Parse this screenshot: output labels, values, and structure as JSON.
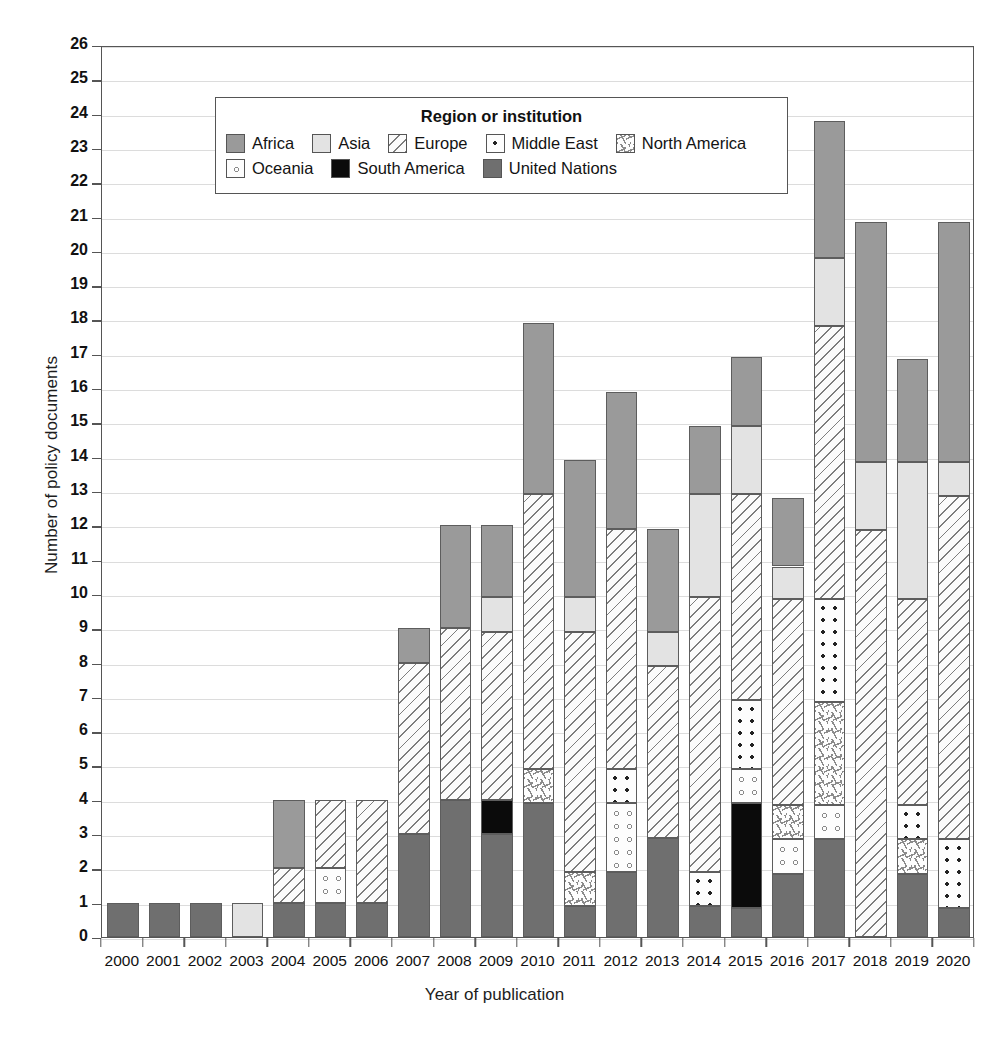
{
  "chart_data": {
    "type": "bar",
    "subtype": "stacked-bar",
    "title": "",
    "xlabel": "Year of publication",
    "ylabel": "Number of policy documents",
    "ylim": [
      0,
      26
    ],
    "ytick_step": 1,
    "grid": true,
    "legend_position": "inside-top-center",
    "legend_title": "Region or institution",
    "categories": [
      "2000",
      "2001",
      "2002",
      "2003",
      "2004",
      "2005",
      "2006",
      "2007",
      "2008",
      "2009",
      "2010",
      "2011",
      "2012",
      "2013",
      "2014",
      "2015",
      "2016",
      "2017",
      "2018",
      "2019",
      "2020"
    ],
    "ytick_labels": [
      "0",
      "1",
      "2",
      "3",
      "4",
      "5",
      "6",
      "7",
      "8",
      "9",
      "10",
      "11",
      "12",
      "13",
      "14",
      "15",
      "16",
      "17",
      "18",
      "19",
      "20",
      "21",
      "22",
      "23",
      "24",
      "25",
      "26"
    ],
    "series": [
      {
        "name": "United Nations",
        "key": "un",
        "color": "#6f6f6f",
        "pattern": "solid-dark-gray",
        "values": [
          1,
          1,
          1,
          0,
          1,
          1,
          1,
          3,
          4,
          3,
          3.9,
          0.9,
          1.9,
          2.9,
          0.9,
          0.85,
          1.85,
          2.85,
          0,
          1.85,
          0.85
        ]
      },
      {
        "name": "South America",
        "key": "samerica",
        "color": "#0b0b0b",
        "pattern": "solid-black",
        "values": [
          0,
          0,
          0,
          0,
          0,
          0,
          0,
          0,
          0,
          1,
          0,
          0,
          0,
          0,
          0,
          3.05,
          0,
          0,
          0,
          0,
          0
        ]
      },
      {
        "name": "Oceania",
        "key": "oceania",
        "color": "#fdfdfd",
        "pattern": "open-circles",
        "values": [
          0,
          0,
          0,
          0,
          0,
          1,
          0,
          0,
          0,
          0,
          0,
          0,
          2,
          0,
          0,
          1,
          1,
          1,
          0,
          0,
          0
        ]
      },
      {
        "name": "North America",
        "key": "namerica",
        "color": "#fdfdfd",
        "pattern": "sparse-dashes",
        "values": [
          0,
          0,
          0,
          0,
          0,
          0,
          0,
          0,
          0,
          0,
          1,
          1,
          0,
          0,
          0,
          0,
          1,
          3,
          0,
          1,
          0
        ]
      },
      {
        "name": "Middle East",
        "key": "mideast",
        "color": "#fdfdfd",
        "pattern": "dots",
        "values": [
          0,
          0,
          0,
          0,
          0,
          0,
          0,
          0,
          0,
          0,
          0,
          0,
          1,
          0,
          1,
          2,
          0,
          3,
          0,
          1,
          2
        ]
      },
      {
        "name": "Europe",
        "key": "europe",
        "color": "#fbfbfb",
        "pattern": "diagonal-hatch",
        "values": [
          0,
          0,
          0,
          0,
          1,
          2,
          3,
          5,
          5,
          4.9,
          8,
          7,
          7,
          5,
          8,
          6,
          6,
          7.95,
          11.85,
          6,
          10
        ]
      },
      {
        "name": "Asia",
        "key": "asia",
        "color": "#e3e3e3",
        "pattern": "solid-light-gray",
        "values": [
          0,
          0,
          0,
          1,
          0,
          0,
          0,
          0,
          0,
          1,
          0,
          1,
          0,
          1,
          3,
          2,
          0.95,
          2,
          2,
          4,
          1
        ]
      },
      {
        "name": "Africa",
        "key": "africa",
        "color": "#9a9a9a",
        "pattern": "solid-medium-gray",
        "values": [
          0,
          0,
          0,
          0,
          2,
          0,
          0,
          1,
          3,
          2.1,
          5,
          4,
          4,
          3,
          2,
          2,
          2,
          4,
          7,
          3,
          7
        ]
      }
    ],
    "totals": [
      1,
      1,
      1,
      1,
      4,
      4,
      4,
      9,
      12,
      12,
      17.9,
      13.9,
      15.9,
      11.9,
      14.9,
      16.9,
      12.85,
      23.85,
      20.85,
      16.85,
      20.85
    ],
    "legend_order": [
      "Africa",
      "Asia",
      "Europe",
      "Middle East",
      "North America",
      "Oceania",
      "South America",
      "United Nations"
    ]
  },
  "legend": {
    "title": "Region or institution",
    "rows": [
      [
        {
          "label": "Africa",
          "swatch": "africa-swatch",
          "cls": "f-africa"
        },
        {
          "label": "Asia",
          "swatch": "asia-swatch",
          "cls": "f-asia"
        },
        {
          "label": "Europe",
          "swatch": "europe-swatch",
          "cls": "f-europe"
        },
        {
          "label": "Middle East",
          "swatch": "middle-east-swatch",
          "cls": "f-mideast"
        },
        {
          "label": "North America",
          "swatch": "north-america-swatch",
          "cls": "f-namerica"
        }
      ],
      [
        {
          "label": "Oceania",
          "swatch": "oceania-swatch",
          "cls": "f-oceania"
        },
        {
          "label": "South America",
          "swatch": "south-america-swatch",
          "cls": "f-samerica"
        },
        {
          "label": "United Nations",
          "swatch": "united-nations-swatch",
          "cls": "f-un"
        }
      ]
    ]
  },
  "axes": {
    "y_title": "Number of policy documents",
    "x_title": "Year of publication"
  }
}
